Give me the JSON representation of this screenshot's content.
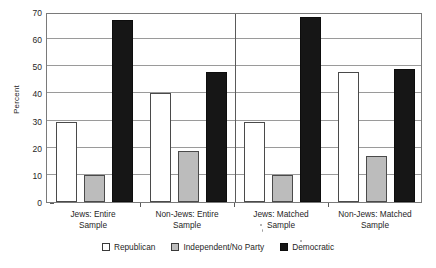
{
  "chart_data": {
    "type": "bar",
    "title": "",
    "xlabel": "",
    "ylabel": "Percent",
    "ylim": [
      0,
      70
    ],
    "yticks": [
      0,
      10,
      20,
      30,
      40,
      50,
      60,
      70
    ],
    "grid": true,
    "legend_position": "bottom",
    "categories": [
      "Jews: Entire Sample",
      "Non-Jews: Entire Sample",
      "Jews: Matched Sample",
      "Non-Jews: Matched Sample"
    ],
    "category_lines": [
      [
        "Jews: Entire",
        "Sample"
      ],
      [
        "Non-Jews: Entire",
        "Sample"
      ],
      [
        "Jews: Matched",
        "Sample"
      ],
      [
        "Non-Jews: Matched",
        "Sample"
      ]
    ],
    "series": [
      {
        "name": "Republican",
        "color": "#ffffff",
        "values": [
          29.5,
          40.0,
          29.5,
          48.0
        ]
      },
      {
        "name": "Independent/No Party",
        "color": "#bcbcbc",
        "values": [
          10.0,
          18.7,
          9.8,
          17.0
        ]
      },
      {
        "name": "Democratic",
        "color": "#161616",
        "values": [
          67.0,
          48.0,
          68.0,
          49.0
        ]
      }
    ]
  },
  "axes": {
    "y_title": "Percent",
    "y_tick_labels": [
      "70",
      "60",
      "50",
      "40",
      "30",
      "20",
      "10",
      "0"
    ]
  },
  "legend": {
    "items": [
      {
        "label": "Republican",
        "swatch": "republican-swatch"
      },
      {
        "label": "Independent/No Party",
        "swatch": "independent-swatch"
      },
      {
        "label": "Democratic",
        "swatch": "democratic-swatch"
      }
    ]
  }
}
